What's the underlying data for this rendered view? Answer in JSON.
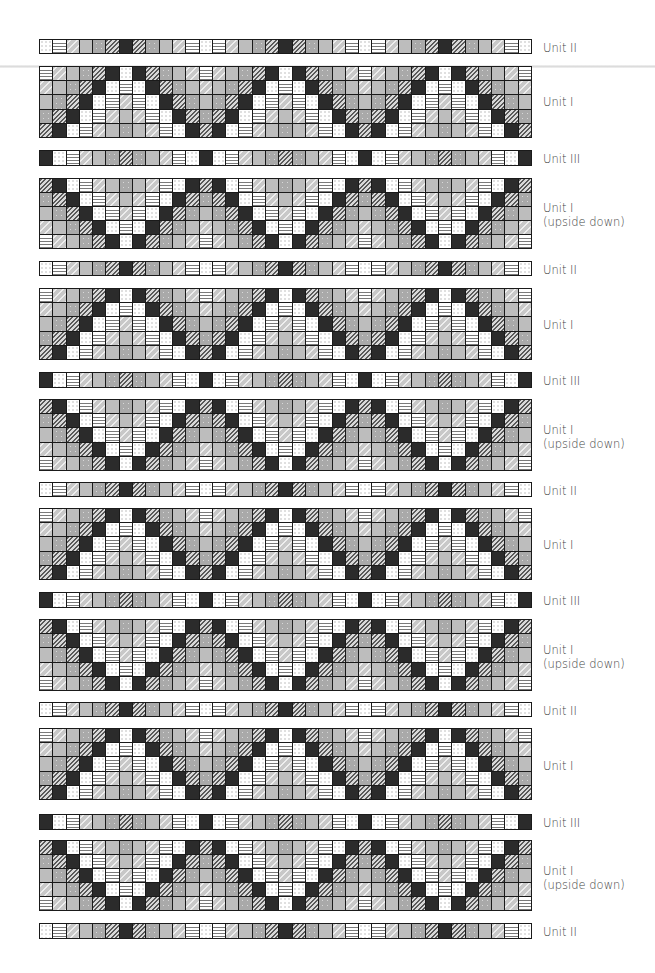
{
  "legend_symbols": {
    "W": "white-dotted",
    "S": "white-horizontal-stripes",
    "V": "light-gray-wave",
    "G": "plain-gray",
    "F": "gray-flecked",
    "H": "dark-diagonal-hatch",
    "K": "black"
  },
  "columns": 37,
  "units": {
    "II": {
      "label": "Unit II",
      "rows": [
        [
          "W",
          "S",
          "V",
          "G",
          "F",
          "H",
          "K",
          "H",
          "F",
          "G",
          "V",
          "S"
        ]
      ]
    },
    "III": {
      "label": "Unit III",
      "rows": [
        [
          "K",
          "W",
          "S",
          "V",
          "G",
          "F",
          "H",
          "F",
          "G",
          "V",
          "S",
          "W"
        ]
      ]
    },
    "I": {
      "label": "Unit I",
      "rows": [
        [
          "S",
          "V",
          "G",
          "F",
          "H",
          "K",
          "W",
          "K",
          "H",
          "F",
          "G",
          "V"
        ],
        [
          "V",
          "G",
          "F",
          "H",
          "K",
          "W",
          "S",
          "W",
          "K",
          "H",
          "F",
          "G"
        ],
        [
          "G",
          "F",
          "H",
          "K",
          "W",
          "S",
          "V",
          "S",
          "W",
          "K",
          "H",
          "F"
        ],
        [
          "F",
          "H",
          "K",
          "W",
          "S",
          "V",
          "G",
          "V",
          "S",
          "W",
          "K",
          "H"
        ],
        [
          "H",
          "K",
          "W",
          "S",
          "V",
          "G",
          "F",
          "G",
          "V",
          "S",
          "W",
          "K"
        ]
      ]
    },
    "IUD": {
      "label": "Unit I\n(upside down)",
      "label_line1": "Unit I",
      "label_line2": "(upside down)",
      "rows": [
        [
          "H",
          "K",
          "W",
          "S",
          "V",
          "G",
          "F",
          "G",
          "V",
          "S",
          "W",
          "K"
        ],
        [
          "F",
          "H",
          "K",
          "W",
          "S",
          "V",
          "G",
          "V",
          "S",
          "W",
          "K",
          "H"
        ],
        [
          "G",
          "F",
          "H",
          "K",
          "W",
          "S",
          "V",
          "S",
          "W",
          "K",
          "H",
          "F"
        ],
        [
          "V",
          "G",
          "F",
          "H",
          "K",
          "W",
          "S",
          "W",
          "K",
          "H",
          "F",
          "G"
        ],
        [
          "S",
          "V",
          "G",
          "F",
          "H",
          "K",
          "W",
          "K",
          "H",
          "F",
          "G",
          "V"
        ]
      ]
    }
  },
  "bands": [
    {
      "unit": "II",
      "top": 39,
      "height": 15,
      "label_top": 41,
      "label": "Unit II"
    },
    {
      "unit": "I",
      "top": 66,
      "height": 72,
      "label_top": 95,
      "label": "Unit I"
    },
    {
      "unit": "III",
      "top": 150,
      "height": 16,
      "label_top": 152,
      "label": "Unit III"
    },
    {
      "unit": "IUD",
      "top": 178,
      "height": 71,
      "label_top": 201,
      "label": "Unit I",
      "label2": "(upside down)"
    },
    {
      "unit": "II",
      "top": 261,
      "height": 15,
      "label_top": 263,
      "label": "Unit II"
    },
    {
      "unit": "I",
      "top": 288,
      "height": 72,
      "label_top": 318,
      "label": "Unit I"
    },
    {
      "unit": "III",
      "top": 372,
      "height": 16,
      "label_top": 374,
      "label": "Unit III"
    },
    {
      "unit": "IUD",
      "top": 399,
      "height": 72,
      "label_top": 423,
      "label": "Unit I",
      "label2": "(upside down)"
    },
    {
      "unit": "II",
      "top": 482,
      "height": 15,
      "label_top": 484,
      "label": "Unit II"
    },
    {
      "unit": "I",
      "top": 508,
      "height": 72,
      "label_top": 538,
      "label": "Unit I"
    },
    {
      "unit": "III",
      "top": 592,
      "height": 16,
      "label_top": 594,
      "label": "Unit III"
    },
    {
      "unit": "IUD",
      "top": 619,
      "height": 72,
      "label_top": 643,
      "label": "Unit I",
      "label2": "(upside down)"
    },
    {
      "unit": "II",
      "top": 702,
      "height": 15,
      "label_top": 704,
      "label": "Unit II"
    },
    {
      "unit": "I",
      "top": 728,
      "height": 72,
      "label_top": 759,
      "label": "Unit I"
    },
    {
      "unit": "III",
      "top": 814,
      "height": 16,
      "label_top": 816,
      "label": "Unit III"
    },
    {
      "unit": "IUD",
      "top": 840,
      "height": 71,
      "label_top": 864,
      "label": "Unit I",
      "label2": "(upside down)"
    },
    {
      "unit": "II",
      "top": 923,
      "height": 16,
      "label_top": 925,
      "label": "Unit II"
    }
  ]
}
